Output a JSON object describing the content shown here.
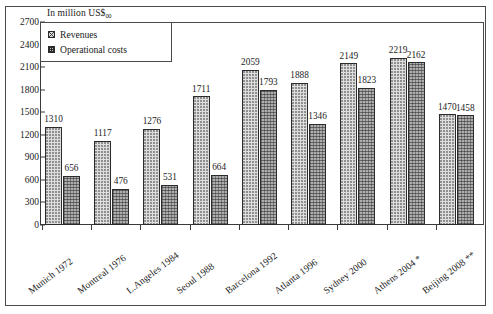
{
  "chart_data": {
    "type": "bar",
    "title": "In million US$",
    "title_subscript": "00",
    "xlabel": "",
    "ylabel": "",
    "ylim": [
      0,
      2700
    ],
    "ytick_step": 300,
    "yticks": [
      0,
      300,
      600,
      900,
      1200,
      1500,
      1800,
      2100,
      2400,
      2700
    ],
    "grid": false,
    "legend_position": "top-left",
    "categories": [
      "Munich 1972",
      "Montreal 1976",
      "L.Angeles 1984",
      "Seoul 1988",
      "Barcelona 1992",
      "Atlanta 1996",
      "Sydney 2000",
      "Athens 2004 *",
      "Beijing 2008 **"
    ],
    "series": [
      {
        "name": "Revenues",
        "values": [
          1310,
          1117,
          1276,
          1711,
          2059,
          1888,
          2149,
          2219,
          1470
        ]
      },
      {
        "name": "Operational costs",
        "values": [
          656,
          476,
          531,
          664,
          1793,
          1346,
          1823,
          2162,
          1458
        ]
      }
    ]
  },
  "legend": {
    "items": [
      {
        "label": "Revenues"
      },
      {
        "label": "Operational costs"
      }
    ]
  },
  "colors": {
    "revenues_fill": "#dedede",
    "costs_fill": "#aeaeae",
    "axis": "#3a3a3a",
    "text": "#1a1a1a"
  }
}
